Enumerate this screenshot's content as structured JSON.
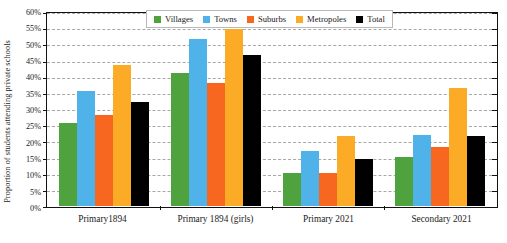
{
  "chart_data": {
    "type": "bar",
    "title": "",
    "xlabel": "",
    "ylabel": "Proportion of students attending private schools",
    "ylim": [
      0,
      60
    ],
    "ytick_step": 5,
    "ytick_labels": [
      "60%",
      "55%",
      "50%",
      "45%",
      "40%",
      "35%",
      "30%",
      "25%",
      "20%",
      "15%",
      "10%",
      "5%",
      "0%"
    ],
    "ytick_values": [
      60,
      55,
      50,
      45,
      40,
      35,
      30,
      25,
      20,
      15,
      10,
      5,
      0
    ],
    "grid": true,
    "grid_style": "dashed",
    "legend_position": "top-center",
    "categories": [
      "Primary1894",
      "Primary 1894 (girls)",
      "Primary 2021",
      "Secondary 2021"
    ],
    "series": [
      {
        "name": "Villages",
        "color": "#4ea33f",
        "values": [
          25.7,
          41.4,
          10.1,
          15.1
        ]
      },
      {
        "name": "Towns",
        "color": "#4fb3ea",
        "values": [
          35.8,
          51.8,
          17.0,
          22.1
        ]
      },
      {
        "name": "Suburbs",
        "color": "#f7671f",
        "values": [
          28.3,
          38.2,
          10.3,
          18.2
        ]
      },
      {
        "name": "Metropoles",
        "color": "#fbab26",
        "values": [
          43.7,
          54.9,
          21.8,
          36.5
        ]
      },
      {
        "name": "Total",
        "color": "#000000",
        "values": [
          32.3,
          46.8,
          14.5,
          21.8
        ]
      }
    ]
  },
  "axis": {
    "y_title": "Proportion of students attending private schools"
  }
}
